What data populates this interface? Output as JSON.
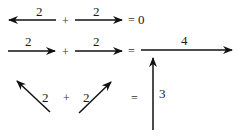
{
  "rows": [
    {
      "name": "opposite-vectors",
      "left": {
        "label": "2",
        "direction": "left"
      },
      "operator": "+",
      "right": {
        "label": "2",
        "direction": "right"
      },
      "equals": "=",
      "result": "0"
    },
    {
      "name": "parallel-vectors",
      "left": {
        "label": "2",
        "direction": "right"
      },
      "operator": "+",
      "right": {
        "label": "2",
        "direction": "right"
      },
      "equals": "=",
      "result": {
        "label": "4",
        "direction": "right"
      }
    },
    {
      "name": "angled-vectors",
      "left": {
        "label": "2",
        "direction": "up-left"
      },
      "operator": "+",
      "right": {
        "label": "2",
        "direction": "up-right"
      },
      "equals": "=",
      "result": {
        "label": "3",
        "direction": "up"
      }
    }
  ],
  "colors": {
    "stroke": "#111111",
    "text": "#1a1a1a"
  }
}
